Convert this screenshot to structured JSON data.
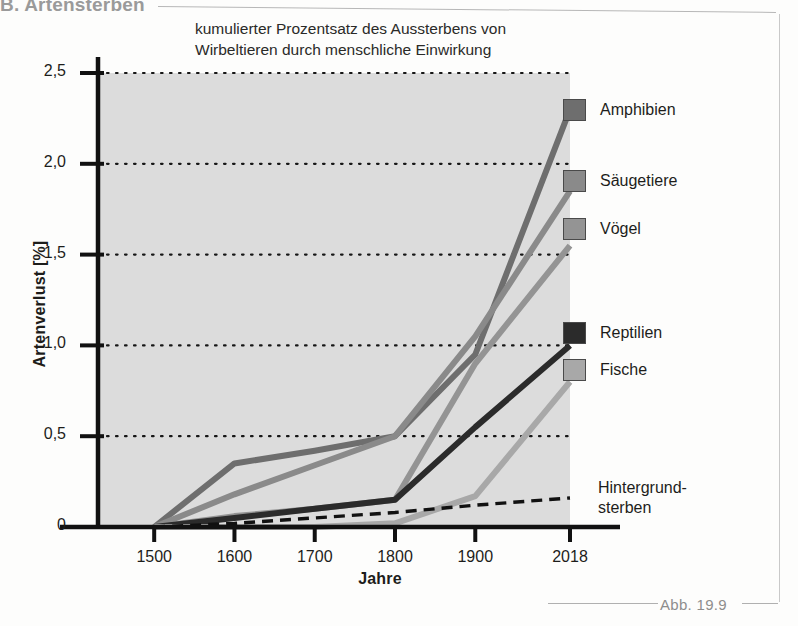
{
  "running_head": "B. Artensterben",
  "caption": "Abb. 19.9",
  "chart_data": {
    "type": "line",
    "title": "kumulierter Prozentsatz des Aussterbens von Wirbeltieren durch menschliche Einwirkung",
    "title_line1": "kumulierter Prozentsatz des Aussterbens von",
    "title_line2": "Wirbeltieren durch menschliche Einwirkung",
    "xlabel": "Jahre",
    "ylabel": "Artenverlust [%]",
    "x": [
      1500,
      1600,
      1700,
      1800,
      1900,
      2018
    ],
    "xtick_labels": [
      "1500",
      "1600",
      "1700",
      "1800",
      "1900",
      "2018"
    ],
    "ytick_labels": [
      "0",
      "0,5",
      "1,0",
      "1,5",
      "2,0",
      "2,5"
    ],
    "ytick_values": [
      0,
      0.5,
      1.0,
      1.5,
      2.0,
      2.5
    ],
    "ylim": [
      0,
      2.5
    ],
    "xlim": [
      1430,
      2018
    ],
    "grid": "horizontal-dotted",
    "legend_position": "right",
    "plot_background": "#dcdcdc",
    "series": [
      {
        "name": "Amphibien",
        "color": "#6e6e6e",
        "values": [
          0.0,
          0.35,
          0.42,
          0.5,
          0.95,
          2.3
        ]
      },
      {
        "name": "Säugetiere",
        "color": "#8a8a8a",
        "values": [
          0.0,
          0.18,
          0.34,
          0.5,
          1.05,
          1.85
        ]
      },
      {
        "name": "Vögel",
        "color": "#949494",
        "values": [
          0.0,
          0.06,
          0.1,
          0.15,
          0.9,
          1.55
        ]
      },
      {
        "name": "Reptilien",
        "color": "#2b2b2b",
        "values": [
          0.0,
          0.05,
          0.1,
          0.15,
          0.55,
          1.0
        ]
      },
      {
        "name": "Fische",
        "color": "#a8a8a8",
        "values": [
          0.0,
          0.0,
          0.0,
          0.02,
          0.17,
          0.8
        ]
      }
    ],
    "annotations": [
      {
        "name": "Hintergrundsterben",
        "style": "dashed",
        "color": "#111111",
        "label_line1": "Hintergrund-",
        "label_line2": "sterben",
        "values": [
          0.0,
          0.02,
          0.05,
          0.08,
          0.12,
          0.16
        ]
      }
    ]
  }
}
